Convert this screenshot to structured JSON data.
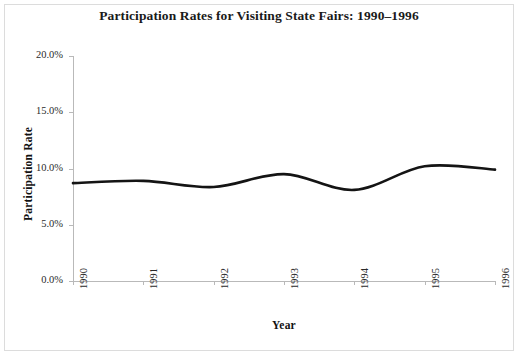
{
  "chart_data": {
    "type": "line",
    "title": "Participation Rates for Visiting State Fairs: 1990–1996",
    "xlabel": "Year",
    "ylabel": "Participation Rate",
    "x": [
      1990,
      1991,
      1992,
      1993,
      1994,
      1995,
      1996
    ],
    "categories": [
      "1990",
      "1991",
      "1992",
      "1993",
      "1994",
      "1995",
      "1996"
    ],
    "values": [
      8.7,
      8.9,
      8.35,
      9.5,
      8.1,
      10.2,
      9.9
    ],
    "series": [
      {
        "name": "Participation Rate",
        "values": [
          8.7,
          8.9,
          8.35,
          9.5,
          8.1,
          10.2,
          9.9
        ]
      }
    ],
    "ylim": [
      0.0,
      20.0
    ],
    "yticks": [
      0.0,
      5.0,
      10.0,
      15.0,
      20.0
    ],
    "ytick_labels": [
      "0.0%",
      "5.0%",
      "10.0%",
      "15.0%",
      "20.0%"
    ],
    "xtick_labels": [
      "1990",
      "1991",
      "1992",
      "1993",
      "1994",
      "1995",
      "1996"
    ],
    "grid": false,
    "legend": "none",
    "line_color": "#141414",
    "axis_color": "#b9b9b9",
    "background_color": "#ffffff",
    "smoothing": "spline"
  }
}
